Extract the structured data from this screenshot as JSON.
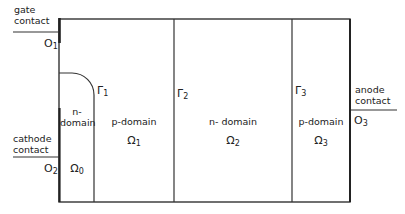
{
  "contacts": {
    "gate": {
      "line1": "gate",
      "line2": "contact",
      "node": "O",
      "node_sub": "1"
    },
    "cathode": {
      "line1": "cathode",
      "line2": "contact",
      "node": "O",
      "node_sub": "2"
    },
    "anode": {
      "line1": "anode",
      "line2": "contact",
      "node": "O",
      "node_sub": "3"
    }
  },
  "interfaces": [
    {
      "symbol": "Γ",
      "sub": "1"
    },
    {
      "symbol": "Γ",
      "sub": "2"
    },
    {
      "symbol": "Γ",
      "sub": "3"
    }
  ],
  "domains": [
    {
      "line1": "n-",
      "line2": "domain",
      "symbol": "Ω",
      "sub": "0"
    },
    {
      "label": "p-domain",
      "symbol": "Ω",
      "sub": "1"
    },
    {
      "label": "n- domain",
      "symbol": "Ω",
      "sub": "2"
    },
    {
      "label": "p-domain",
      "symbol": "Ω",
      "sub": "3"
    }
  ]
}
